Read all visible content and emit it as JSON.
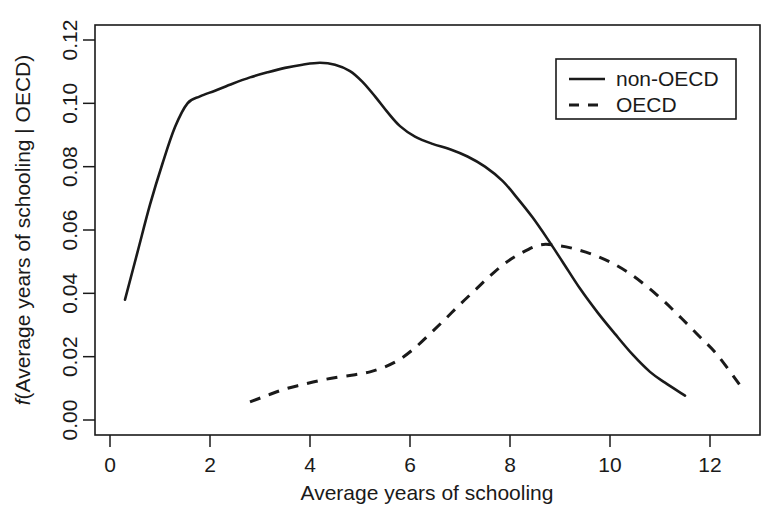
{
  "chart_data": {
    "type": "line",
    "title": "",
    "xlabel": "Average years of schooling",
    "ylabel": "f(Average years of schooling | OECD)",
    "ylabel_italic_prefix": "f",
    "ylabel_rest": "(Average years of schooling | OECD)",
    "xlim": [
      -0.35,
      13.3
    ],
    "ylim": [
      -0.004,
      0.1265
    ],
    "xticks": [
      0,
      2,
      4,
      6,
      8,
      10,
      12
    ],
    "xticklabels": [
      "0",
      "2",
      "4",
      "6",
      "8",
      "10",
      "12"
    ],
    "yticks": [
      0.0,
      0.02,
      0.04,
      0.06,
      0.08,
      0.1,
      0.12
    ],
    "yticklabels": [
      "0.00",
      "0.02",
      "0.04",
      "0.06",
      "0.08",
      "0.10",
      "0.12"
    ],
    "grid": false,
    "legend_position": "top-right",
    "line_color": "#1a1a1a",
    "background_color": "#ffffff",
    "series": [
      {
        "name": "non-OECD",
        "style": "solid",
        "x": [
          0.3,
          0.55,
          0.8,
          1.05,
          1.3,
          1.55,
          1.8,
          2.1,
          2.45,
          2.8,
          3.15,
          3.5,
          3.85,
          4.2,
          4.5,
          4.8,
          5.05,
          5.3,
          5.55,
          5.8,
          6.1,
          6.45,
          6.8,
          7.15,
          7.5,
          7.85,
          8.15,
          8.45,
          8.75,
          9.05,
          9.4,
          9.75,
          10.1,
          10.45,
          10.8,
          11.1,
          11.5
        ],
        "y": [
          0.038,
          0.053,
          0.068,
          0.081,
          0.0925,
          0.1,
          0.1022,
          0.104,
          0.1062,
          0.1082,
          0.1098,
          0.1112,
          0.1122,
          0.1128,
          0.1122,
          0.1102,
          0.1068,
          0.1022,
          0.0972,
          0.0928,
          0.0895,
          0.0872,
          0.0855,
          0.0832,
          0.08,
          0.0755,
          0.07,
          0.064,
          0.0572,
          0.05,
          0.0415,
          0.034,
          0.0272,
          0.0207,
          0.0152,
          0.0118,
          0.0077
        ]
      },
      {
        "name": "OECD",
        "style": "dashed",
        "x": [
          2.8,
          3.15,
          3.5,
          3.85,
          4.2,
          4.55,
          4.9,
          5.2,
          5.5,
          5.8,
          6.1,
          6.4,
          6.7,
          7.0,
          7.3,
          7.6,
          7.9,
          8.2,
          8.6,
          9.0,
          9.35,
          9.7,
          10.05,
          10.4,
          10.75,
          11.1,
          11.45,
          11.8,
          12.15,
          12.6
        ],
        "y": [
          0.0057,
          0.0078,
          0.0098,
          0.0112,
          0.0125,
          0.0135,
          0.0143,
          0.0152,
          0.0168,
          0.0192,
          0.0228,
          0.0272,
          0.0318,
          0.0365,
          0.041,
          0.0455,
          0.0495,
          0.0525,
          0.0553,
          0.055,
          0.0538,
          0.052,
          0.0495,
          0.0462,
          0.042,
          0.0372,
          0.0318,
          0.0262,
          0.0205,
          0.011
        ]
      }
    ]
  },
  "legend": {
    "entries": [
      {
        "label": "non-OECD",
        "style": "solid"
      },
      {
        "label": "OECD",
        "style": "dashed"
      }
    ]
  }
}
